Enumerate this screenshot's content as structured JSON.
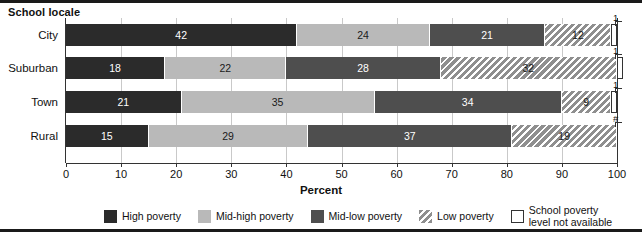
{
  "chart_data": {
    "type": "bar",
    "orientation": "horizontal",
    "stacked": true,
    "stack_mode": "percent",
    "title": "",
    "axis_title": "School locale",
    "xlabel": "Percent",
    "ylabel": "",
    "xlim": [
      0,
      100
    ],
    "xticks": [
      0,
      10,
      20,
      30,
      40,
      50,
      60,
      70,
      80,
      90,
      100
    ],
    "xticklabels": [
      "0",
      "10",
      "20",
      "30",
      "40",
      "50",
      "60",
      "70",
      "80",
      "90",
      "100"
    ],
    "grid": true,
    "legend_position": "bottom",
    "categories": [
      "City",
      "Suburban",
      "Town",
      "Rural"
    ],
    "series": [
      {
        "name": "High poverty",
        "key": "high",
        "color": "#2b2b2b",
        "values": [
          42,
          18,
          21,
          15
        ]
      },
      {
        "name": "Mid-high poverty",
        "key": "midhigh",
        "color": "#b9b9b9",
        "values": [
          24,
          22,
          35,
          29
        ]
      },
      {
        "name": "Mid-low poverty",
        "key": "midlow",
        "color": "#4e4e4e",
        "values": [
          21,
          28,
          34,
          37
        ]
      },
      {
        "name": "Low poverty",
        "key": "low",
        "color": "#8f8f8f",
        "values": [
          12,
          32,
          9,
          19
        ]
      },
      {
        "name": "School poverty\nlevel not available",
        "key": "na",
        "color": "#ffffff",
        "values": [
          1,
          1,
          1,
          0
        ]
      }
    ],
    "callouts": [
      {
        "category": "City",
        "text": "1"
      },
      {
        "category": "Suburban",
        "text": "1"
      },
      {
        "category": "Town",
        "text": "1"
      },
      {
        "category": "Rural",
        "text": "#"
      }
    ]
  },
  "legend": {
    "items": [
      {
        "label": "High poverty",
        "key": "high"
      },
      {
        "label": "Mid-high poverty",
        "key": "midhigh"
      },
      {
        "label": "Mid-low poverty",
        "key": "midlow"
      },
      {
        "label": "Low poverty",
        "key": "low"
      },
      {
        "label": "School poverty\nlevel not available",
        "key": "na"
      }
    ]
  }
}
